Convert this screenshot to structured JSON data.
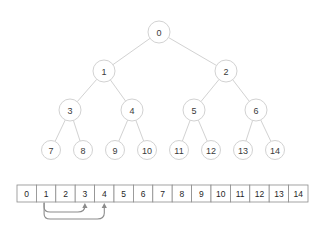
{
  "figure": {
    "title": "",
    "caption": "",
    "background_color": "#ffffff",
    "node_fill": "#ffffff",
    "node_stroke": "#d2d2d2",
    "edge_color": "#d2d2d2",
    "cell_stroke": "#8c8c8c",
    "arrow_color": "#8c8c8c",
    "text_color": "#3a3a3a"
  },
  "tree": {
    "type": "binary-heap-tree",
    "levels": 4,
    "nodes": [
      {
        "label": "0",
        "level": 0,
        "index": 0,
        "cx": 159,
        "cy": 32
      },
      {
        "label": "1",
        "level": 1,
        "index": 1,
        "cx": 104,
        "cy": 71
      },
      {
        "label": "2",
        "level": 1,
        "index": 2,
        "cx": 226,
        "cy": 71
      },
      {
        "label": "3",
        "level": 2,
        "index": 3,
        "cx": 70,
        "cy": 110
      },
      {
        "label": "4",
        "level": 2,
        "index": 4,
        "cx": 132,
        "cy": 110
      },
      {
        "label": "5",
        "level": 2,
        "index": 5,
        "cx": 194,
        "cy": 110
      },
      {
        "label": "6",
        "level": 2,
        "index": 6,
        "cx": 256,
        "cy": 110
      },
      {
        "label": "7",
        "level": 3,
        "index": 7,
        "cx": 51,
        "cy": 150
      },
      {
        "label": "8",
        "level": 3,
        "index": 8,
        "cx": 83,
        "cy": 150
      },
      {
        "label": "9",
        "level": 3,
        "index": 9,
        "cx": 115,
        "cy": 150
      },
      {
        "label": "10",
        "level": 3,
        "index": 10,
        "cx": 147,
        "cy": 150
      },
      {
        "label": "11",
        "level": 3,
        "index": 11,
        "cx": 179,
        "cy": 150
      },
      {
        "label": "12",
        "level": 3,
        "index": 12,
        "cx": 211,
        "cy": 150
      },
      {
        "label": "13",
        "level": 3,
        "index": 13,
        "cx": 243,
        "cy": 150
      },
      {
        "label": "14",
        "level": 3,
        "index": 14,
        "cx": 275,
        "cy": 150
      }
    ],
    "edges": [
      {
        "from": 0,
        "to": 1
      },
      {
        "from": 0,
        "to": 2
      },
      {
        "from": 1,
        "to": 3
      },
      {
        "from": 1,
        "to": 4
      },
      {
        "from": 2,
        "to": 5
      },
      {
        "from": 2,
        "to": 6
      },
      {
        "from": 3,
        "to": 7
      },
      {
        "from": 3,
        "to": 8
      },
      {
        "from": 4,
        "to": 9
      },
      {
        "from": 4,
        "to": 10
      },
      {
        "from": 5,
        "to": 11
      },
      {
        "from": 5,
        "to": 12
      },
      {
        "from": 6,
        "to": 13
      },
      {
        "from": 6,
        "to": 14
      }
    ],
    "node_radius": 11,
    "leaf_radius": 9.5
  },
  "array": {
    "cells": [
      "0",
      "1",
      "2",
      "3",
      "4",
      "5",
      "6",
      "7",
      "8",
      "9",
      "10",
      "11",
      "12",
      "13",
      "14"
    ],
    "x": 17,
    "y": 185,
    "cell_width": 19.4,
    "cell_height": 17
  },
  "pointers": [
    {
      "from_index": 1,
      "to_index": 3,
      "label": "left-child"
    },
    {
      "from_index": 1,
      "to_index": 4,
      "label": "right-child"
    }
  ]
}
